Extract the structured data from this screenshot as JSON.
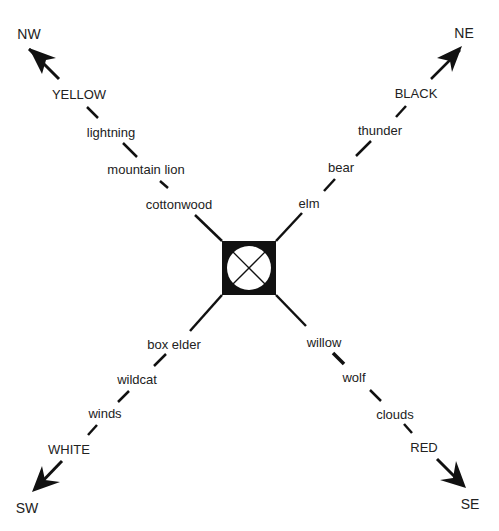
{
  "diagram": {
    "type": "four-directions cosmology diagram",
    "center_symbol": "square with circle and X",
    "directions": [
      {
        "key": "nw",
        "label": "NW",
        "color": "YELLOW",
        "items": [
          "lightning",
          "mountain lion",
          "cottonwood"
        ]
      },
      {
        "key": "ne",
        "label": "NE",
        "color": "BLACK",
        "items": [
          "thunder",
          "bear",
          "elm"
        ]
      },
      {
        "key": "sw",
        "label": "SW",
        "color": "WHITE",
        "items": [
          "winds",
          "wildcat",
          "box elder"
        ]
      },
      {
        "key": "se",
        "label": "SE",
        "color": "RED",
        "items": [
          "clouds",
          "wolf",
          "willow"
        ]
      }
    ]
  }
}
